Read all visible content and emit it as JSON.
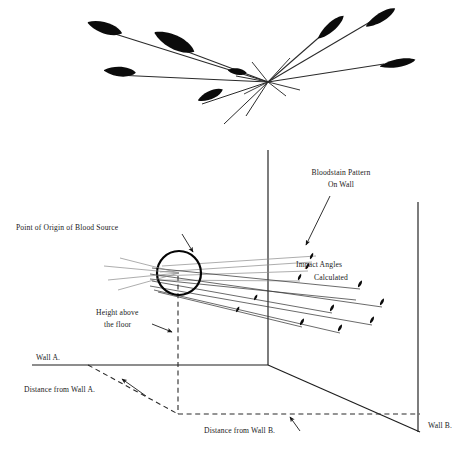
{
  "figure": {
    "title_visible": false,
    "background_color": "#ffffff",
    "ink_color": "#111111",
    "width": 455,
    "height": 455
  },
  "top_panel": {
    "name": "convergence-pattern-overhead",
    "description_visible": false,
    "convergence_point": {
      "x": 268,
      "y": 82
    },
    "stains": [
      {
        "id": "stain-1",
        "tip_x": 88,
        "tip_y": 22,
        "angle_deg": 200,
        "length": 34,
        "width": 13
      },
      {
        "id": "stain-2",
        "tip_x": 108,
        "tip_y": 72,
        "angle_deg": 186,
        "length": 30,
        "width": 12
      },
      {
        "id": "stain-3",
        "tip_x": 160,
        "tip_y": 35,
        "angle_deg": 208,
        "length": 42,
        "width": 16
      },
      {
        "id": "stain-4",
        "tip_x": 196,
        "tip_y": 100,
        "angle_deg": 160,
        "length": 26,
        "width": 11
      },
      {
        "id": "stain-5",
        "tip_x": 232,
        "tip_y": 73,
        "angle_deg": 190,
        "length": 17,
        "width": 9
      },
      {
        "id": "stain-6",
        "tip_x": 330,
        "tip_y": 25,
        "angle_deg": 28,
        "length": 34,
        "width": 12
      },
      {
        "id": "stain-7",
        "tip_x": 378,
        "tip_y": 14,
        "angle_deg": 18,
        "length": 34,
        "width": 12
      },
      {
        "id": "stain-8",
        "tip_x": 392,
        "tip_y": 62,
        "angle_deg": 5,
        "length": 36,
        "width": 11
      }
    ]
  },
  "bottom_panel": {
    "name": "room-reconstruction-3d",
    "labels": {
      "bloodstain_pattern": {
        "line1": "Bloodstain Pattern",
        "line2": "On Wall"
      },
      "point_of_origin": "Point of Origin of Blood Source",
      "impact_angles": {
        "line1": "Impact Angles",
        "line2": "Calculated"
      },
      "height_above_floor": {
        "line1": "Height above",
        "line2": "the floor"
      },
      "wall_a": "Wall A.",
      "wall_b": "Wall B.",
      "distance_from_wall_a": "Distance from Wall A.",
      "distance_from_wall_b": "Distance from Wall B."
    },
    "origin": {
      "x": 179,
      "y": 273,
      "radius": 22
    },
    "room": {
      "corner_vertical_x": 268,
      "corner_top_y": 150,
      "corner_bottom_y": 365,
      "wall_a_floor_line_y": 365,
      "wall_b_right_edge_x": 418,
      "wall_b_top_y": 202,
      "wall_b_bottom_y": 432,
      "floor_point_x": 178,
      "floor_point_y": 414
    },
    "trajectories": [
      {
        "id": "traj-1",
        "end_x": 312,
        "end_y": 262,
        "weight": "faint"
      },
      {
        "id": "traj-2",
        "end_x": 308,
        "end_y": 271,
        "weight": "faint"
      },
      {
        "id": "traj-3",
        "end_x": 300,
        "end_y": 281,
        "weight": "faint"
      },
      {
        "id": "traj-4",
        "end_x": 360,
        "end_y": 289,
        "weight": "thin"
      },
      {
        "id": "traj-5",
        "end_x": 382,
        "end_y": 307,
        "weight": "thin"
      },
      {
        "id": "traj-6",
        "end_x": 332,
        "end_y": 313,
        "weight": "thin"
      },
      {
        "id": "traj-7",
        "end_x": 372,
        "end_y": 325,
        "weight": "thin"
      },
      {
        "id": "traj-8",
        "end_x": 340,
        "end_y": 333,
        "weight": "thin"
      },
      {
        "id": "traj-9",
        "end_x": 302,
        "end_y": 327,
        "weight": "thin"
      }
    ]
  }
}
